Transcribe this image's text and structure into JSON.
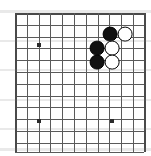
{
  "figure": {
    "board_size_visible_cols": 12,
    "board_size_visible_rows": 12,
    "background_color": "#ffffff",
    "line_color": "#5a5a5a",
    "edge_color": "#4a4a4a",
    "black_stone_color": "#111111",
    "white_stone_color": "#ffffff",
    "star_point_color": "#2b2b2b"
  },
  "geometry": {
    "origin_x": 15,
    "origin_y": 13,
    "cell": 11.8,
    "cols": 11,
    "rows": 11,
    "stone_radius": 7.4,
    "star_size": 4
  },
  "grid": {
    "columns": [
      {
        "index": 0,
        "x": 15,
        "edge": true
      },
      {
        "index": 1,
        "x": 26.8,
        "edge": false
      },
      {
        "index": 2,
        "x": 38.6,
        "edge": false
      },
      {
        "index": 3,
        "x": 50.4,
        "edge": false
      },
      {
        "index": 4,
        "x": 62.2,
        "edge": false
      },
      {
        "index": 5,
        "x": 74.0,
        "edge": false
      },
      {
        "index": 6,
        "x": 85.8,
        "edge": false
      },
      {
        "index": 7,
        "x": 97.6,
        "edge": false
      },
      {
        "index": 8,
        "x": 109.4,
        "edge": false
      },
      {
        "index": 9,
        "x": 121.2,
        "edge": false
      },
      {
        "index": 10,
        "x": 133.0,
        "edge": false
      },
      {
        "index": 11,
        "x": 144.0,
        "edge": true
      }
    ],
    "rows": [
      {
        "index": 0,
        "y": 13,
        "edge": true
      },
      {
        "index": 1,
        "y": 24.8,
        "edge": false
      },
      {
        "index": 2,
        "y": 36.6,
        "edge": false
      },
      {
        "index": 3,
        "y": 48.4,
        "edge": false
      },
      {
        "index": 4,
        "y": 60.2,
        "edge": false
      },
      {
        "index": 5,
        "y": 72.0,
        "edge": false
      },
      {
        "index": 6,
        "y": 83.8,
        "edge": false
      },
      {
        "index": 7,
        "y": 95.6,
        "edge": false
      },
      {
        "index": 8,
        "y": 107.4,
        "edge": false
      },
      {
        "index": 9,
        "y": 119.2,
        "edge": false
      },
      {
        "index": 10,
        "y": 131.0,
        "edge": false
      },
      {
        "index": 11,
        "y": 143.0,
        "edge": false
      },
      {
        "index": 12,
        "y": 152.0,
        "edge": false
      }
    ]
  },
  "star_points": [
    {
      "name": "star-point-upper-left",
      "x": 39,
      "y": 45
    },
    {
      "name": "star-point-lower-left",
      "x": 39,
      "y": 121
    },
    {
      "name": "star-point-lower-right",
      "x": 112,
      "y": 121
    }
  ],
  "stones": [
    {
      "id": "black-1",
      "color": "black",
      "label": "black stone upper",
      "x": 110,
      "y": 34
    },
    {
      "id": "white-1",
      "color": "white",
      "label": "white stone upper right",
      "x": 125,
      "y": 34
    },
    {
      "id": "black-2",
      "color": "black",
      "label": "black stone middle left",
      "x": 97,
      "y": 48
    },
    {
      "id": "white-2",
      "color": "white",
      "label": "white stone middle",
      "x": 112,
      "y": 48
    },
    {
      "id": "black-3",
      "color": "black",
      "label": "black stone lower left",
      "x": 97,
      "y": 62
    },
    {
      "id": "white-3",
      "color": "white",
      "label": "white stone lower",
      "x": 112,
      "y": 62
    }
  ],
  "scan_artifacts": [
    {
      "x": 0,
      "y": 10,
      "w": 151,
      "h": 3
    },
    {
      "x": 0,
      "y": 40,
      "w": 151,
      "h": 2
    },
    {
      "x": 0,
      "y": 69,
      "w": 151,
      "h": 2
    },
    {
      "x": 0,
      "y": 99,
      "w": 151,
      "h": 2
    },
    {
      "x": 0,
      "y": 128,
      "w": 151,
      "h": 2
    },
    {
      "x": 0,
      "y": 148,
      "w": 151,
      "h": 3
    }
  ]
}
